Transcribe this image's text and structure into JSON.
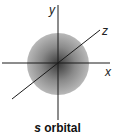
{
  "diagram": {
    "title": "s orbital",
    "caption_prefix": "s",
    "caption_suffix": " orbital",
    "axes": {
      "x_label": "x",
      "y_label": "y",
      "z_label": "z"
    },
    "colors": {
      "sphere_center": "#3a3a3a",
      "sphere_edge": "#b5b5b5",
      "axis": "#1a1a1a"
    }
  }
}
